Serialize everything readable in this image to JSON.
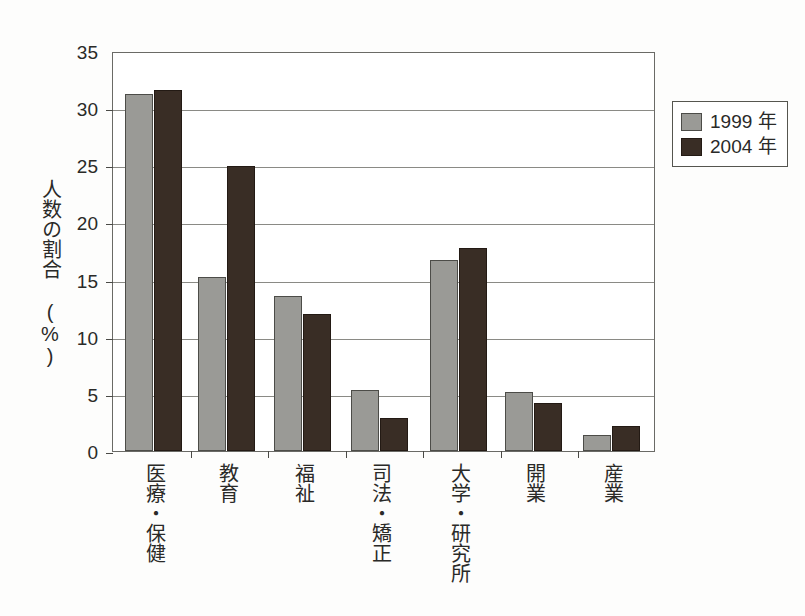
{
  "chart_data": {
    "type": "bar",
    "title": "",
    "subtitle": "",
    "xlabel": "",
    "ylabel": "人数の割合（%）",
    "ylabel_lines": [
      "人数の割合",
      "(%)"
    ],
    "ylim": [
      0,
      35
    ],
    "ytick_step": 5,
    "yticks": [
      35,
      30,
      25,
      20,
      15,
      10,
      5,
      0
    ],
    "ytick_labels": [
      "35",
      "30",
      "25",
      "20",
      "15",
      "10",
      "5",
      "0"
    ],
    "grid": true,
    "grid_axis": "y",
    "legend_position": "upper-right-outside",
    "categories": [
      "医療・保健",
      "教育",
      "福祉",
      "司法・矯正",
      "大学・研究所",
      "開業",
      "産業"
    ],
    "series": [
      {
        "name": "1999 年",
        "color": "#9a9a96",
        "edge_color": "#4c4c48",
        "values": [
          31.2,
          15.2,
          13.6,
          5.3,
          16.7,
          5.2,
          1.4
        ]
      },
      {
        "name": "2004 年",
        "color": "#392d25",
        "edge_color": "#231a14",
        "values": [
          31.6,
          24.9,
          12.0,
          2.9,
          17.8,
          4.2,
          2.2
        ]
      }
    ]
  },
  "legend": {
    "entries": [
      {
        "label": "1999 年"
      },
      {
        "label": "2004 年"
      }
    ]
  },
  "colors": {
    "series_1999": "#9a9a96",
    "series_2004": "#392d25",
    "axis": "#6a6a66",
    "gridline": "#8a8a85",
    "text": "#2a2a28",
    "background": "#ffffff"
  }
}
